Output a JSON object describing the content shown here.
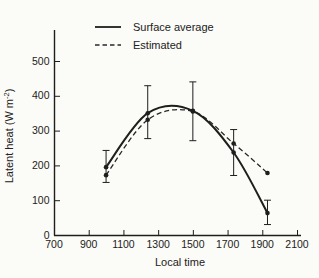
{
  "figure": {
    "paper_color": "#fbfbf8",
    "ink_color": "#1f1e1d"
  },
  "chart_data": {
    "type": "line",
    "title": "",
    "xlabel": "Local time",
    "ylabel": "Latent heat (W m⁻²)",
    "ylabel_parts": {
      "base": "Latent heat (W m",
      "sup": "-2",
      "close": ")"
    },
    "xlim": [
      700,
      2100
    ],
    "ylim": [
      0,
      500
    ],
    "xticks": [
      "700",
      "900",
      "1100",
      "1300",
      "1500",
      "1700",
      "1900",
      "2100"
    ],
    "xtick_values": [
      700,
      900,
      1100,
      1300,
      1500,
      1700,
      1900,
      2100
    ],
    "yticks": [
      "0",
      "100",
      "200",
      "300",
      "400",
      "500"
    ],
    "ytick_values": [
      0,
      100,
      200,
      300,
      400,
      500
    ],
    "grid": false,
    "legend_position": "top-left-inside",
    "x": [
      1000,
      1240,
      1500,
      1735,
      1930
    ],
    "series": [
      {
        "name": "Surface average",
        "style": "solid",
        "marker": "circle",
        "values": [
          195,
          350,
          357,
          237,
          63
        ],
        "error_low": [
          151,
          277,
          271,
          171,
          30
        ],
        "error_high": [
          243,
          429,
          440,
          303,
          100
        ]
      },
      {
        "name": "Estimated",
        "style": "dashed",
        "marker": "circle",
        "values": [
          172,
          331,
          355,
          263,
          178
        ]
      }
    ]
  }
}
